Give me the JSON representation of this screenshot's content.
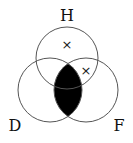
{
  "diagram": {
    "type": "venn",
    "sets": [
      {
        "label": "H",
        "cx": 67,
        "cy": 58,
        "r": 31
      },
      {
        "label": "D",
        "cx": 50,
        "cy": 90,
        "r": 32
      },
      {
        "label": "F",
        "cx": 86,
        "cy": 90,
        "r": 32
      }
    ],
    "labels": {
      "top": "H",
      "left": "D",
      "right": "F"
    },
    "marks": [
      {
        "symbol": "×",
        "region": "H only",
        "x": 67,
        "y": 48
      },
      {
        "symbol": "×",
        "region": "H and F, not D",
        "x": 86,
        "y": 75
      }
    ],
    "shaded_region": "D and F",
    "shade_color": "#000000",
    "line_color": "#555555"
  }
}
